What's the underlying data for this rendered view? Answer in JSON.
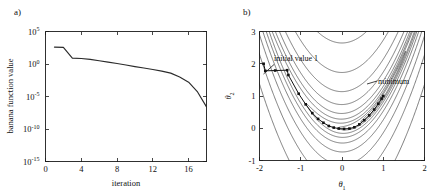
{
  "figure": {
    "panels": [
      {
        "tag": "a)",
        "name": "convergence-plot"
      },
      {
        "tag": "b)",
        "name": "contour-plot"
      }
    ]
  },
  "chart_data": [
    {
      "type": "line",
      "panel_tag": "a)",
      "title": "",
      "xlabel": "iteration",
      "ylabel": "banana function value",
      "xlim": [
        0,
        18
      ],
      "ylim_log10": [
        -15,
        5
      ],
      "yscale": "log",
      "grid": false,
      "legend": "none",
      "xticks": [
        0,
        4,
        8,
        12,
        16
      ],
      "xtick_labels": [
        "0",
        "4",
        "8",
        "12",
        "16"
      ],
      "yticks_log10": [
        5,
        0,
        -5,
        -10,
        -15
      ],
      "ytick_labels": [
        "10^5",
        "10^0",
        "10^-5",
        "10^-10",
        "10^-15"
      ],
      "ytick_mantissa": "10",
      "ytick_exponents": [
        "5",
        "0",
        "-5",
        "-10",
        "-15"
      ],
      "x": [
        1,
        2,
        3,
        4,
        5,
        6,
        7,
        8,
        9,
        10,
        11,
        12,
        13,
        14,
        15,
        16,
        17,
        18
      ],
      "y_log10": [
        2.6,
        2.55,
        0.9,
        0.85,
        0.72,
        0.5,
        0.28,
        0.08,
        -0.15,
        -0.4,
        -0.62,
        -0.85,
        -1.1,
        -1.4,
        -2.0,
        -2.8,
        -4.3,
        -6.6
      ],
      "series_name": "banana function value"
    },
    {
      "type": "contour",
      "panel_tag": "b)",
      "title": "",
      "xlabel": "theta_1",
      "xlabel_base": "θ",
      "xlabel_sub": "1",
      "ylabel": "theta_2",
      "ylabel_base": "θ",
      "ylabel_sub": "2",
      "xlim": [
        -2,
        2
      ],
      "ylim": [
        -1,
        3
      ],
      "grid": false,
      "legend": "none",
      "xticks": [
        -2,
        -1,
        0,
        1,
        2
      ],
      "xtick_labels": [
        "-2",
        "-1",
        "0",
        "1",
        "2"
      ],
      "yticks": [
        -1,
        0,
        1,
        2,
        3
      ],
      "ytick_labels": [
        "-1",
        "0",
        "1",
        "2",
        "3"
      ],
      "function": "banana (Rosenbrock)",
      "contour_levels": [
        0.3,
        1.2,
        3.5,
        9,
        22,
        55,
        130,
        300,
        700
      ],
      "annotations": [
        {
          "text": "initial value 1",
          "points_to": [
            -1.9,
            2.0
          ]
        },
        {
          "text": "minimum",
          "points_to": [
            1.0,
            1.0
          ]
        }
      ],
      "optimization_path": [
        [
          -1.9,
          2.0
        ],
        [
          -1.86,
          1.78
        ],
        [
          -1.62,
          1.79
        ],
        [
          -1.33,
          1.8
        ],
        [
          -1.3,
          1.65
        ],
        [
          -1.05,
          1.07
        ],
        [
          -0.88,
          0.74
        ],
        [
          -0.72,
          0.47
        ],
        [
          -0.58,
          0.29
        ],
        [
          -0.45,
          0.17
        ],
        [
          -0.32,
          0.07
        ],
        [
          -0.2,
          0.02
        ],
        [
          -0.08,
          -0.01
        ],
        [
          0.05,
          -0.02
        ],
        [
          0.18,
          -0.01
        ],
        [
          0.3,
          0.03
        ],
        [
          0.42,
          0.12
        ],
        [
          0.54,
          0.25
        ],
        [
          0.66,
          0.4
        ],
        [
          0.78,
          0.58
        ],
        [
          0.88,
          0.76
        ],
        [
          0.96,
          0.92
        ],
        [
          1.0,
          1.0
        ]
      ]
    }
  ]
}
